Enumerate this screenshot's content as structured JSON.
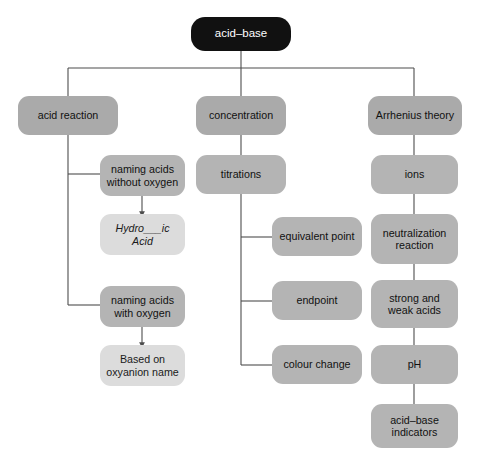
{
  "diagram": {
    "colors": {
      "root_fill": "#111111",
      "root_text": "#ffffff",
      "node_fill": "#aaaaaa",
      "node_fill_alt": "#b4b4b4",
      "leaf_fill": "#dcdcdc",
      "text": "#111111",
      "connector": "#4d4d4d",
      "background": "#ffffff"
    },
    "nodes": {
      "root": "acid–base",
      "acid_reaction": "acid reaction",
      "concentration": "concentration",
      "arrhenius_theory": "Arrhenius theory",
      "naming_without_oxygen": "naming acids\nwithout oxygen",
      "hydro_ic_acid": "Hydro___ic\nAcid",
      "naming_with_oxygen": "naming acids\nwith oxygen",
      "based_on_oxyanion": "Based on\noxyanion name",
      "titrations": "titrations",
      "equivalent_point": "equivalent point",
      "endpoint": "endpoint",
      "colour_change": "colour change",
      "ions": "ions",
      "neutralization_reaction": "neutralization\nreaction",
      "strong_and_weak_acids": "strong and\nweak acids",
      "ph": "pH",
      "acid_base_indicators": "acid–base\nindicators"
    }
  }
}
